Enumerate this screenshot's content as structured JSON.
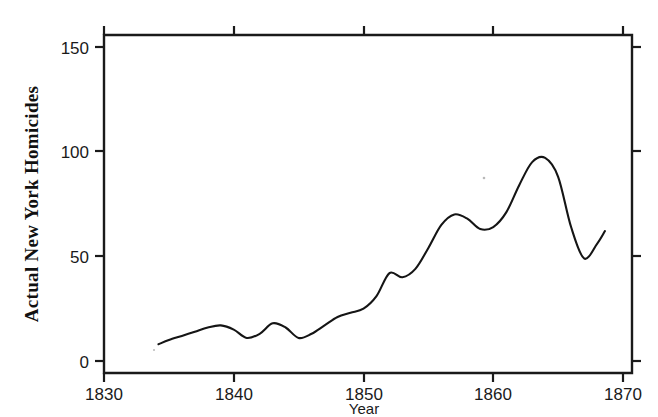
{
  "chart_data": {
    "type": "line",
    "title": "",
    "subtitle": "",
    "xlabel": "Year",
    "ylabel": "Actual New York Homicides",
    "xlim": [
      1830,
      1870
    ],
    "ylim": [
      0,
      155
    ],
    "grid": false,
    "legend": null,
    "legend_position": "none",
    "x_ticks": [
      1830,
      1840,
      1850,
      1860,
      1870
    ],
    "x_tick_labels": [
      "1830",
      "1840",
      "1850",
      "1860",
      "1870"
    ],
    "y_ticks": [
      0,
      50,
      100,
      150
    ],
    "y_tick_labels": [
      "0",
      "50",
      "100",
      "150"
    ],
    "line_color": "#151515",
    "series": [
      {
        "name": "Actual New York Homicides",
        "x": [
          1834.2,
          1835.0,
          1836.0,
          1837.0,
          1838.0,
          1839.0,
          1840.0,
          1841.0,
          1842.0,
          1843.0,
          1844.0,
          1845.0,
          1846.0,
          1847.0,
          1848.0,
          1849.0,
          1850.0,
          1851.0,
          1852.0,
          1853.0,
          1854.0,
          1855.0,
          1856.0,
          1857.0,
          1858.0,
          1859.0,
          1860.0,
          1861.0,
          1862.0,
          1863.0,
          1864.0,
          1865.0,
          1866.0,
          1867.0,
          1868.0,
          1868.6
        ],
        "y": [
          8,
          10,
          12,
          14,
          16,
          17,
          15,
          11,
          13,
          18,
          16,
          11,
          13,
          17,
          21,
          23,
          25,
          31,
          42,
          40,
          44,
          54,
          65,
          70,
          68,
          63,
          64,
          71,
          84,
          95,
          97,
          88,
          64,
          49,
          56,
          62
        ]
      }
    ],
    "annotations": []
  },
  "axes": {
    "y_axis_title": "Actual New York Homicides",
    "x_axis_title": "Year"
  }
}
